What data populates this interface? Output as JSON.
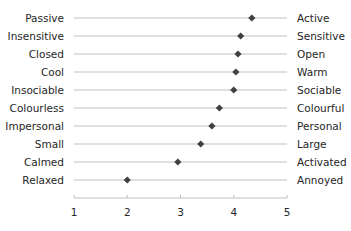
{
  "chart_data": {
    "type": "scatter",
    "subtype": "semantic-differential dot plot",
    "title": "",
    "xlabel": "",
    "ylabel": "",
    "xlim": [
      1,
      5
    ],
    "xticks": [
      1,
      2,
      3,
      4,
      5
    ],
    "grid": "horizontal row lines",
    "legend": "none",
    "marker": "diamond",
    "marker_color": "#404040",
    "line_color": "#bfbfbf",
    "rows": [
      {
        "left": "Passive",
        "right": "Active",
        "value": 4.34
      },
      {
        "left": "Insensitive",
        "right": "Sensitive",
        "value": 4.13
      },
      {
        "left": "Closed",
        "right": "Open",
        "value": 4.08
      },
      {
        "left": "Cool",
        "right": "Warm",
        "value": 4.04
      },
      {
        "left": "Insociable",
        "right": "Sociable",
        "value": 4.0
      },
      {
        "left": "Colourless",
        "right": "Colourful",
        "value": 3.73
      },
      {
        "left": "Impersonal",
        "right": "Personal",
        "value": 3.59
      },
      {
        "left": "Small",
        "right": "Large",
        "value": 3.38
      },
      {
        "left": "Calmed",
        "right": "Activated",
        "value": 2.95
      },
      {
        "left": "Relaxed",
        "right": "Annoyed",
        "value": 2.0
      }
    ]
  }
}
